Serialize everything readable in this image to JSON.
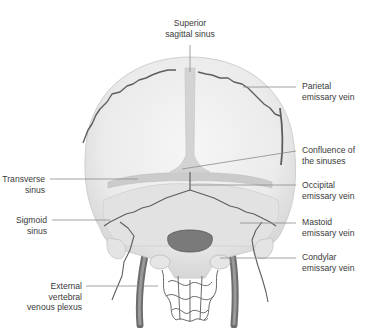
{
  "figure": {
    "labels": {
      "superior_sagittal_sinus": {
        "line1": "Superior",
        "line2": "sagittal sinus"
      },
      "parietal_emissary_vein": {
        "line1": "Parietal",
        "line2": "emissary vein"
      },
      "confluence_of_sinuses": {
        "line1": "Confluence of",
        "line2": "the sinuses"
      },
      "occipital_emissary_vein": {
        "line1": "Occipital",
        "line2": "emissary vein"
      },
      "mastoid_emissary_vein": {
        "line1": "Mastoid",
        "line2": "emissary vein"
      },
      "condylar_emissary_vein": {
        "line1": "Condylar",
        "line2": "emissary vein"
      },
      "transverse_sinus": {
        "line1": "Transverse",
        "line2": "sinus"
      },
      "sigmoid_sinus": {
        "line1": "Sigmoid",
        "line2": "sinus"
      },
      "external_vertebral_venous_plexus": {
        "line1": "External",
        "line2": "vertebral",
        "line3": "venous plexus"
      }
    },
    "colors": {
      "bone": "#ececec",
      "bone_shadow": "#d4d4d4",
      "sinus": "#c9c9c9",
      "vein": "#6a6a6a",
      "leader_line": "#8a8a8a",
      "text": "#3a3a3a"
    }
  }
}
